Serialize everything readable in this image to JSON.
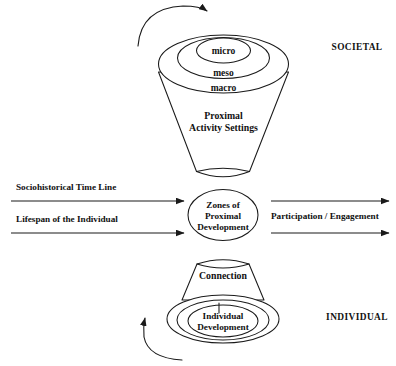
{
  "diagram": {
    "background_color": "#ffffff",
    "line_color": "#1a1a1a",
    "text_color": "#111111",
    "top_cone": {
      "rings": [
        {
          "id": "micro",
          "label": "micro"
        },
        {
          "id": "meso",
          "label": "meso"
        },
        {
          "id": "macro",
          "label": "macro"
        }
      ],
      "body_label_line1": "Proximal",
      "body_label_line2": "Activity Settings"
    },
    "center": {
      "label_line1": "Zones of",
      "label_line2": "Proximal",
      "label_line3": "Development"
    },
    "bottom_cone": {
      "body_label": "Connection",
      "core_label_line1": "Individual",
      "core_label_line2": "Development"
    },
    "left_axes": [
      {
        "id": "sociohistorical",
        "label": "Sociohistorical Time Line"
      },
      {
        "id": "lifespan",
        "label": "Lifespan of the Individual"
      }
    ],
    "right_axes": {
      "label": "Participation / Engagement"
    },
    "side_labels": [
      {
        "id": "societal",
        "label": "SOCIETAL"
      },
      {
        "id": "individual",
        "label": "INDIVIDUAL"
      }
    ],
    "curved_arrows": [
      {
        "id": "top-clockwise",
        "direction": "clockwise"
      },
      {
        "id": "bottom-counterclockwise",
        "direction": "counterclockwise"
      }
    ]
  }
}
